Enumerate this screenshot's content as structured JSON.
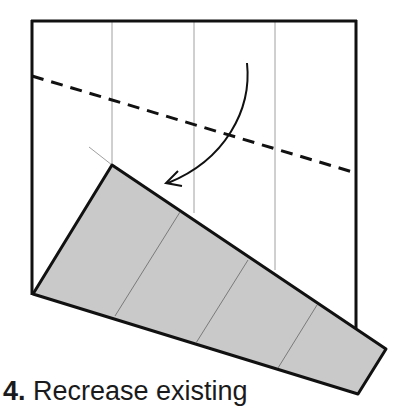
{
  "caption": {
    "step_number": "4.",
    "text": " Recrease existing"
  },
  "colors": {
    "outline": "#111111",
    "thin_crease": "#9a9a9a",
    "flap_fill": "#c9c9c9",
    "background": "#ffffff"
  },
  "diagram": {
    "type": "origami-step",
    "elements": [
      "paper-square",
      "vertical-crease-lines",
      "dashed-valley-fold-line",
      "curved-fold-arrow",
      "folded-flap"
    ]
  }
}
